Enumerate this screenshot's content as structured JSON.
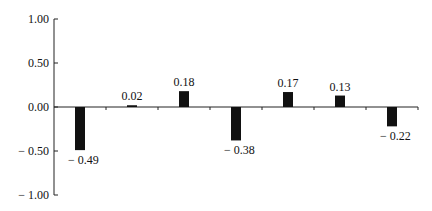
{
  "chart_data": {
    "type": "bar",
    "title": "",
    "xlabel": "",
    "ylabel": "",
    "categories": [
      "1",
      "2",
      "3",
      "4",
      "5",
      "6",
      "7"
    ],
    "values": [
      -0.49,
      0.02,
      0.18,
      -0.38,
      0.17,
      0.13,
      -0.22
    ],
    "data_labels": [
      "− 0.49",
      "0.02",
      "0.18",
      "− 0.38",
      "0.17",
      "0.13",
      "− 0.22"
    ],
    "ylim": [
      -1.0,
      1.0
    ],
    "yticks": [
      1.0,
      0.5,
      0.0,
      -0.5,
      -1.0
    ],
    "ytick_labels": [
      "1.00",
      "0.50",
      "0.00",
      "− 0.50",
      "− 1.00"
    ],
    "grid": false,
    "legend": null,
    "bar_color": "#111111"
  }
}
